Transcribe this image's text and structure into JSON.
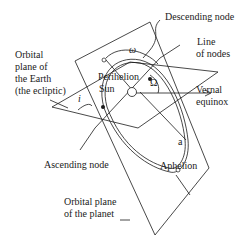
{
  "diagram": {
    "labels": {
      "descending_node": "Descending node",
      "line_of_nodes_1": "Line",
      "line_of_nodes_2": "of nodes",
      "ecliptic_1": "Orbital",
      "ecliptic_2": "plane of",
      "ecliptic_3": "the Earth",
      "ecliptic_4": "(the ecliptic)",
      "perihelion": "Perihelion",
      "sun": "Sun",
      "vernal_1": "Vernal",
      "vernal_2": "equinox",
      "ascending_node": "Ascending node",
      "aphelion": "Aphelion",
      "planet_plane_1": "Orbital plane",
      "planet_plane_2": "of the planet"
    },
    "symbols": {
      "inclination": "i",
      "arg_perihelion": "ω",
      "long_asc_node": "Ω",
      "semi_major": "a"
    },
    "colors": {
      "line": "#1a1a1a",
      "background": "#ffffff"
    }
  }
}
